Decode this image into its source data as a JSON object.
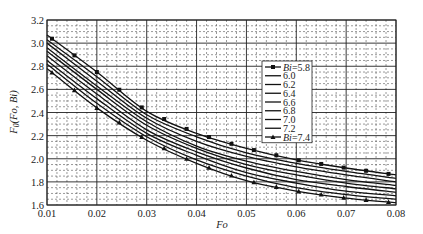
{
  "chart_data": {
    "type": "line",
    "title": "",
    "xlabel": "Fo",
    "ylabel": "F0(Fo,Bi)",
    "xlim": [
      0.01,
      0.08
    ],
    "ylim": [
      1.6,
      3.2
    ],
    "x_ticks": [
      "0.01",
      "0.02",
      "0.03",
      "0.04",
      "0.05",
      "0.06",
      "0.07",
      "0.08"
    ],
    "y_ticks": [
      "1.6",
      "1.8",
      "2.0",
      "2.2",
      "2.4",
      "2.6",
      "2.8",
      "3.0",
      "3.2"
    ],
    "grid": true,
    "legend_position": "upper right (inside)",
    "x": [
      0.01,
      0.02,
      0.03,
      0.04,
      0.05,
      0.06,
      0.07,
      0.08
    ],
    "series": [
      {
        "name": "Bi=5.8",
        "marker": "square",
        "values": [
          3.07,
          2.75,
          2.41,
          2.22,
          2.09,
          1.99,
          1.92,
          1.86
        ]
      },
      {
        "name": "6.0",
        "marker": "none",
        "values": [
          3.03,
          2.71,
          2.38,
          2.19,
          2.05,
          1.96,
          1.89,
          1.83
        ]
      },
      {
        "name": "6.2",
        "marker": "none",
        "values": [
          3.0,
          2.67,
          2.35,
          2.15,
          2.02,
          1.93,
          1.86,
          1.8
        ]
      },
      {
        "name": "6.4",
        "marker": "none",
        "values": [
          2.96,
          2.63,
          2.32,
          2.11,
          1.98,
          1.89,
          1.82,
          1.77
        ]
      },
      {
        "name": "6.6",
        "marker": "none",
        "values": [
          2.93,
          2.6,
          2.29,
          2.09,
          1.95,
          1.86,
          1.79,
          1.74
        ]
      },
      {
        "name": "6.8",
        "marker": "none",
        "values": [
          2.89,
          2.56,
          2.25,
          2.06,
          1.92,
          1.82,
          1.76,
          1.71
        ]
      },
      {
        "name": "7.0",
        "marker": "none",
        "values": [
          2.85,
          2.52,
          2.22,
          2.03,
          1.88,
          1.79,
          1.72,
          1.68
        ]
      },
      {
        "name": "7.2",
        "marker": "none",
        "values": [
          2.82,
          2.48,
          2.19,
          1.99,
          1.85,
          1.75,
          1.69,
          1.65
        ]
      },
      {
        "name": "Bi=7.4",
        "marker": "triangle",
        "values": [
          2.78,
          2.44,
          2.16,
          1.96,
          1.81,
          1.72,
          1.66,
          1.62
        ]
      }
    ]
  }
}
